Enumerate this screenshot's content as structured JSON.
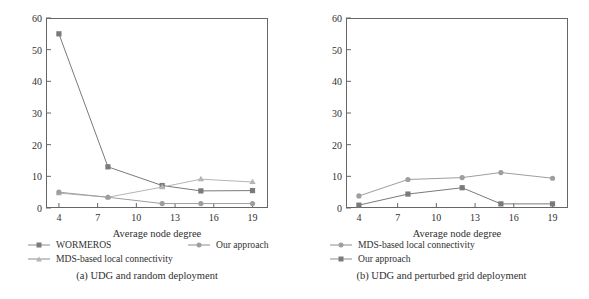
{
  "chart_data": [
    {
      "type": "line",
      "panel": "a",
      "title": "(a)  UDG and random deployment",
      "xlabel": "Average node degree",
      "ylabel": "Number of false positives",
      "x": [
        4,
        7.8,
        12,
        15,
        19
      ],
      "xticks": [
        4,
        7,
        10,
        13,
        16,
        19
      ],
      "yticks": [
        0,
        10,
        20,
        30,
        40,
        50,
        60
      ],
      "xlim": [
        3,
        20.2
      ],
      "ylim": [
        0,
        60
      ],
      "grid": false,
      "legend_position": "below-plot",
      "series": [
        {
          "name": "WORMEROS",
          "marker": "square",
          "color": "#7a7a7a",
          "values": [
            55,
            13,
            7.1,
            5.4,
            5.5
          ]
        },
        {
          "name": "MDS-based local connectivity",
          "marker": "triangle",
          "color": "#b5b5b5",
          "values": [
            4.7,
            3.4,
            6.6,
            9.1,
            8.2
          ]
        },
        {
          "name": "Our approach",
          "marker": "circle",
          "color": "#9e9e9e",
          "values": [
            5.0,
            3.4,
            1.4,
            1.4,
            1.4
          ]
        }
      ]
    },
    {
      "type": "line",
      "panel": "b",
      "title": "(b)  UDG and perturbed grid deployment",
      "xlabel": "Average node degree",
      "ylabel": "Number of false positives",
      "x": [
        4,
        7.8,
        12,
        15,
        19
      ],
      "xticks": [
        4,
        7,
        10,
        13,
        16,
        19
      ],
      "yticks": [
        0,
        10,
        20,
        30,
        40,
        50,
        60
      ],
      "xlim": [
        3,
        20.2
      ],
      "ylim": [
        0,
        60
      ],
      "grid": false,
      "legend_position": "below-plot",
      "series": [
        {
          "name": "MDS-based local connectivity",
          "marker": "circle",
          "color": "#9e9e9e",
          "values": [
            3.8,
            9.0,
            9.6,
            11.2,
            9.4
          ]
        },
        {
          "name": "Our approach",
          "marker": "square",
          "color": "#7a7a7a",
          "values": [
            0.9,
            4.4,
            6.4,
            1.3,
            1.3
          ]
        }
      ]
    }
  ],
  "panel_a": {
    "ylabel": "Number of false positives",
    "xlabel": "Average node degree",
    "caption": "(a)  UDG and random deployment",
    "legend": [
      {
        "label": "WORMEROS"
      },
      {
        "label": "Our approach"
      },
      {
        "label": "MDS-based local connectivity"
      }
    ],
    "yticks": [
      "0",
      "10",
      "20",
      "30",
      "40",
      "50",
      "60"
    ],
    "xticks": [
      "4",
      "7",
      "10",
      "13",
      "16",
      "19"
    ]
  },
  "panel_b": {
    "ylabel": "Number of false positives",
    "xlabel": "Average node degree",
    "caption": "(b)  UDG and perturbed grid deployment",
    "legend": [
      {
        "label": "MDS-based local connectivity"
      },
      {
        "label": "Our approach"
      }
    ],
    "yticks": [
      "0",
      "10",
      "20",
      "30",
      "40",
      "50",
      "60"
    ],
    "xticks": [
      "4",
      "7",
      "10",
      "13",
      "16",
      "19"
    ]
  }
}
